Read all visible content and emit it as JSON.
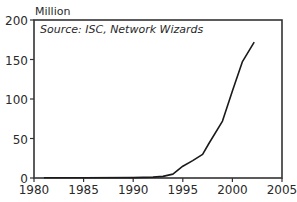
{
  "chart_data": {
    "type": "line",
    "title": "",
    "unit_label": "Million",
    "annotation": "Source: ISC, Network Wizards",
    "xlabel": "",
    "ylabel": "Million",
    "xlim": [
      1980,
      2005
    ],
    "ylim": [
      0,
      200
    ],
    "xticks": [
      1980,
      1985,
      1990,
      1995,
      2000,
      2005
    ],
    "yticks": [
      0,
      50,
      100,
      150,
      200
    ],
    "grid": false,
    "legend": null,
    "series": [
      {
        "name": "Internet hosts",
        "x": [
          1981,
          1985,
          1990,
          1991,
          1992,
          1993,
          1994,
          1995,
          1996,
          1997,
          1997.6,
          1999,
          2000,
          2001,
          2002.2
        ],
        "values": [
          0.2,
          0.3,
          0.5,
          0.8,
          1.2,
          2,
          5,
          15,
          22,
          30,
          43,
          72,
          110,
          147,
          172
        ]
      }
    ]
  }
}
